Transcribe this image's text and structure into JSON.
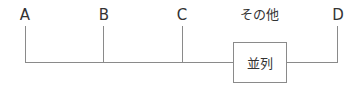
{
  "diagram": {
    "labels": [
      {
        "id": "A",
        "text": "A"
      },
      {
        "id": "B",
        "text": "B"
      },
      {
        "id": "C",
        "text": "C"
      },
      {
        "id": "other",
        "text": "その他"
      },
      {
        "id": "D",
        "text": "D"
      }
    ],
    "box": {
      "text": "並列"
    },
    "colors": {
      "line": "#8a8a8a",
      "text": "#333333"
    }
  }
}
